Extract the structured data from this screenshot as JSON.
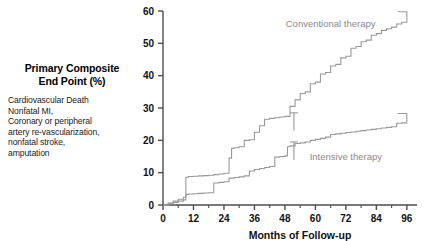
{
  "caption": {
    "title_line1": "Primary Composite",
    "title_line2": "End Point  (%)",
    "detail_lines": [
      "Cardiovascular Death",
      "Nonfatal MI,",
      "Coronary or peripheral",
      "artery re-vascularization,",
      "nonfatal stroke,",
      "amputation"
    ]
  },
  "chart_data": {
    "type": "line",
    "title": "",
    "xlabel": "Months of Follow-up",
    "ylabel": "Primary Composite End Point (%)",
    "xlim": [
      0,
      100
    ],
    "ylim": [
      0,
      60
    ],
    "xticks": [
      0,
      12,
      24,
      36,
      48,
      60,
      72,
      84,
      96
    ],
    "xticklabels": [
      "0",
      "12",
      "24",
      "36",
      "48",
      "60",
      "72",
      "84",
      "96"
    ],
    "xminorticks": [
      6,
      18,
      30,
      42,
      54,
      66,
      78,
      90
    ],
    "yticks": [
      0,
      10,
      20,
      30,
      40,
      50,
      60
    ],
    "yticklabels": [
      "0",
      "10",
      "20",
      "30",
      "40",
      "50",
      "60"
    ],
    "grid": false,
    "legend_position": "inline-annotations",
    "step_style": "post",
    "line_color": "#9a9a9a",
    "series": [
      {
        "name": "Conventional therapy",
        "label_x": 66,
        "label_y": 55,
        "final_value": 57,
        "x": [
          0,
          2,
          4,
          6,
          8,
          9,
          10,
          12,
          14,
          16,
          18,
          20,
          22,
          24,
          26,
          27,
          28,
          30,
          32,
          34,
          36,
          38,
          40,
          42,
          44,
          46,
          48,
          50,
          52,
          54,
          56,
          58,
          60,
          62,
          64,
          66,
          68,
          70,
          72,
          74,
          76,
          78,
          80,
          82,
          84,
          86,
          88,
          90,
          92,
          94,
          96
        ],
        "y": [
          0,
          0.6,
          1.2,
          1.8,
          2.4,
          8.6,
          8.8,
          8.9,
          9.0,
          9.1,
          9.2,
          9.4,
          9.6,
          9.8,
          14.5,
          17.5,
          17.7,
          18.0,
          20.0,
          20.2,
          22.5,
          24.5,
          26.5,
          26.8,
          27.0,
          27.2,
          27.4,
          30.5,
          32.5,
          34.5,
          35.0,
          37.5,
          38.0,
          40.5,
          41.0,
          43.0,
          43.5,
          45.5,
          46.0,
          48.5,
          49.0,
          50.5,
          51.0,
          52.5,
          53.0,
          54.0,
          54.5,
          55.0,
          56.0,
          56.5,
          57.0
        ],
        "errorbar": {
          "x": 48,
          "value": 27.4,
          "lower": 23.0,
          "upper": 28.5
        }
      },
      {
        "name": "Intensive therapy",
        "label_x": 72,
        "label_y": 14,
        "final_value": 25.5,
        "x": [
          0,
          2,
          4,
          6,
          8,
          9,
          10,
          12,
          14,
          16,
          18,
          20,
          22,
          24,
          26,
          28,
          30,
          32,
          34,
          36,
          38,
          40,
          42,
          44,
          46,
          48,
          49,
          50,
          52,
          54,
          56,
          58,
          60,
          62,
          64,
          66,
          68,
          70,
          72,
          74,
          76,
          78,
          80,
          82,
          84,
          86,
          88,
          90,
          92,
          94,
          96
        ],
        "y": [
          0,
          0.4,
          0.8,
          1.2,
          1.6,
          3.3,
          3.4,
          3.5,
          3.6,
          3.7,
          3.8,
          6.8,
          7.0,
          7.2,
          8.3,
          8.5,
          8.7,
          9.0,
          10.5,
          11.0,
          11.3,
          11.6,
          11.9,
          14.8,
          15.0,
          15.2,
          18.0,
          18.3,
          19.0,
          19.2,
          19.5,
          20.0,
          20.3,
          20.6,
          21.0,
          21.8,
          22.0,
          22.2,
          22.4,
          22.6,
          22.8,
          23.0,
          23.2,
          23.4,
          23.6,
          23.8,
          24.0,
          24.2,
          25.3,
          25.4,
          25.5
        ],
        "errorbar": {
          "x": 48,
          "value": 15.2,
          "lower": 14.0,
          "upper": 19.5
        }
      }
    ]
  }
}
